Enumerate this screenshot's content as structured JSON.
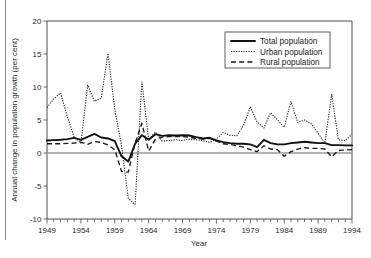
{
  "chart_data": {
    "type": "line",
    "title": "",
    "xlabel": "Year",
    "ylabel": "Annual change in population growth (per cent)",
    "xlim": [
      1949,
      1994
    ],
    "ylim": [
      -10,
      20
    ],
    "y_ticks": [
      -10,
      -5,
      0,
      5,
      10,
      15,
      20
    ],
    "y_tick_labels": [
      "-10",
      "-5",
      "0",
      "5",
      "10",
      "15",
      "20"
    ],
    "x_ticks_labeled": [
      1949,
      1954,
      1959,
      1964,
      1969,
      1974,
      1979,
      1984,
      1989,
      1994
    ],
    "x_tick_labels": [
      "1949",
      "1954",
      "1959",
      "1964",
      "1969",
      "1974",
      "1979",
      "1984",
      "1989",
      "1994"
    ],
    "x_tick_interval": 1,
    "grid": false,
    "zero_line": true,
    "legend_position": "top-right",
    "x": [
      1949,
      1950,
      1951,
      1952,
      1953,
      1954,
      1955,
      1956,
      1957,
      1958,
      1959,
      1960,
      1961,
      1962,
      1963,
      1964,
      1965,
      1966,
      1967,
      1968,
      1969,
      1970,
      1971,
      1972,
      1973,
      1974,
      1975,
      1976,
      1977,
      1978,
      1979,
      1980,
      1981,
      1982,
      1983,
      1984,
      1985,
      1986,
      1987,
      1988,
      1989,
      1990,
      1991,
      1992,
      1993,
      1994
    ],
    "series": [
      {
        "name": "Total population",
        "style": "solid",
        "values": [
          1.9,
          1.95,
          2.0,
          2.1,
          2.3,
          2.0,
          2.45,
          2.9,
          2.35,
          2.2,
          1.8,
          -0.5,
          -1.3,
          1.4,
          2.7,
          2.0,
          2.85,
          2.6,
          2.7,
          2.65,
          2.7,
          2.65,
          2.4,
          2.2,
          2.3,
          1.9,
          1.65,
          1.5,
          1.4,
          1.4,
          1.3,
          0.9,
          2.0,
          1.5,
          1.3,
          1.3,
          1.5,
          1.6,
          1.7,
          1.6,
          1.5,
          1.5,
          1.2,
          1.2,
          1.15,
          1.15
        ]
      },
      {
        "name": "Urban population",
        "style": "dotted",
        "values": [
          6.9,
          8.2,
          9.1,
          5.5,
          2.4,
          1.5,
          10.3,
          7.8,
          8.3,
          15.1,
          6.6,
          1.1,
          -6.9,
          -7.8,
          10.8,
          2.0,
          3.2,
          1.8,
          1.9,
          2.0,
          1.9,
          2.1,
          2.0,
          1.9,
          1.6,
          2.1,
          3.1,
          2.7,
          2.6,
          4.2,
          7.0,
          4.7,
          3.8,
          6.1,
          5.0,
          3.9,
          7.8,
          4.6,
          5.0,
          4.4,
          3.0,
          1.5,
          8.9,
          2.0,
          1.9,
          2.8
        ]
      },
      {
        "name": "Rural population",
        "style": "dashed",
        "values": [
          1.4,
          1.4,
          1.4,
          1.45,
          1.5,
          1.65,
          1.3,
          1.75,
          1.6,
          1.2,
          0.5,
          -2.8,
          -2.9,
          1.5,
          4.5,
          0.3,
          2.1,
          2.4,
          2.5,
          2.5,
          2.5,
          2.4,
          2.2,
          2.1,
          2.2,
          1.8,
          1.4,
          1.3,
          1.1,
          0.9,
          0.5,
          0.2,
          1.1,
          0.6,
          0.5,
          -0.5,
          0.2,
          0.6,
          0.8,
          0.7,
          0.7,
          0.6,
          -0.6,
          0.4,
          0.45,
          0.5
        ]
      }
    ]
  },
  "legend": {
    "items": [
      {
        "label": "Total population"
      },
      {
        "label": "Urban population"
      },
      {
        "label": "Rural population"
      }
    ]
  }
}
